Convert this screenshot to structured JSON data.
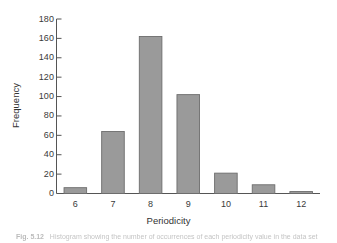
{
  "chart_data": {
    "type": "bar",
    "title": "",
    "xlabel": "Periodicity",
    "ylabel": "Frequency",
    "categories": [
      "6",
      "7",
      "8",
      "9",
      "10",
      "11",
      "12"
    ],
    "values": [
      6,
      64,
      162,
      102,
      21,
      9,
      2
    ],
    "series": [
      {
        "name": "Frequency",
        "values": [
          6,
          64,
          162,
          102,
          21,
          9,
          2
        ]
      }
    ],
    "ylim": [
      0,
      180
    ],
    "yticks": [
      0,
      20,
      40,
      60,
      80,
      100,
      120,
      140,
      160,
      180
    ],
    "ytick_labels": [
      "0",
      "20",
      "40",
      "60",
      "80",
      "100",
      "120",
      "140",
      "160",
      "180"
    ],
    "grid": false,
    "legend": "none",
    "bar_color": "#9a9a9a",
    "bar_edge_color": "#6d6d6d",
    "axis_color": "#555555",
    "background": "#ffffff"
  },
  "caption": {
    "figure_label": "Fig. 5.12",
    "text": "illegible scanned caption"
  }
}
